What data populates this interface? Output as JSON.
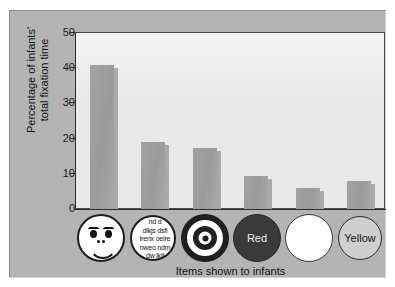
{
  "chart_data": {
    "type": "bar",
    "title": "",
    "xlabel": "Items shown to infants",
    "ylabel": "Percentage of infants' total fixation time",
    "ylim": [
      0,
      50
    ],
    "yticks": [
      0,
      10,
      20,
      30,
      40,
      50
    ],
    "grid": false,
    "legend": null,
    "categories": [
      "face",
      "print",
      "bullseye",
      "red",
      "white",
      "yellow"
    ],
    "category_labels": [
      "",
      "",
      "",
      "Red",
      "",
      "Yellow"
    ],
    "values": [
      41,
      19,
      17.3,
      9.5,
      6,
      8
    ]
  },
  "axes": {
    "y_title_line1": "Percentage of infants'",
    "y_title_line2": "total fixation time",
    "x_title": "Items shown to infants",
    "tick_50": "50",
    "tick_40": "40",
    "tick_30": "30",
    "tick_20": "20",
    "tick_10": "10",
    "tick_0": "0"
  },
  "icons": [
    {
      "name": "smiley-face-icon",
      "label": ""
    },
    {
      "name": "newsprint-icon",
      "label": ""
    },
    {
      "name": "bullseye-icon",
      "label": ""
    },
    {
      "name": "red-disc-icon",
      "label": "Red"
    },
    {
      "name": "white-disc-icon",
      "label": ""
    },
    {
      "name": "yellow-disc-icon",
      "label": "Yellow"
    }
  ],
  "print_text": {
    "line1": "nd d",
    "line2": "dlkjs dsfl",
    "line3": "irenx oeire",
    "line4": "nweo ndm",
    "line5": "dw lkjt"
  },
  "colors": {
    "panel": "#b4b4b4",
    "plot_background": "#e9e9e9",
    "bar": "#9f9f9f",
    "axis": "#2d2d2d",
    "text": "#111111"
  }
}
